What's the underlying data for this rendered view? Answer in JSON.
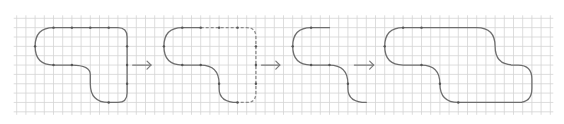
{
  "diagram": {
    "grid": {
      "columns": 58,
      "rows": 10
    },
    "colors": {
      "grid": "#d4d4d4",
      "path": "#6e6e6e",
      "dashed": "#8a8a8a",
      "node": "#555555"
    },
    "stages": [
      {
        "id": "stage-1",
        "style": "solid",
        "path": [
          [
            "M",
            2,
            3
          ],
          [
            "Q",
            2,
            1,
            4,
            1
          ],
          [
            "L",
            11,
            1
          ],
          [
            "Q",
            12,
            1,
            12,
            2
          ],
          [
            "L",
            12,
            8
          ],
          [
            "Q",
            12,
            9,
            11,
            9
          ],
          [
            "L",
            10,
            9
          ],
          [
            "Q",
            8,
            9,
            8,
            7
          ],
          [
            "L",
            8,
            6
          ],
          [
            "Q",
            8,
            5,
            6,
            5
          ],
          [
            "L",
            4,
            5
          ],
          [
            "Q",
            2,
            5,
            2,
            3
          ]
        ],
        "nodes": [
          [
            4,
            1
          ],
          [
            6,
            1
          ],
          [
            8,
            1
          ],
          [
            10,
            1
          ],
          [
            12,
            3
          ],
          [
            12,
            5
          ],
          [
            12,
            7
          ],
          [
            10,
            9
          ],
          [
            6,
            5
          ],
          [
            4,
            5
          ],
          [
            2,
            3
          ]
        ]
      },
      {
        "id": "stage-2",
        "style": "partial-dashed",
        "solid_path": [
          [
            "M",
            20,
            1
          ],
          [
            "L",
            18,
            1
          ],
          [
            "Q",
            16,
            1,
            16,
            3
          ],
          [
            "Q",
            16,
            5,
            18,
            5
          ],
          [
            "L",
            20,
            5
          ],
          [
            "Q",
            22,
            5,
            22,
            7
          ],
          [
            "L",
            22,
            7.5
          ],
          [
            "Q",
            22,
            9,
            24,
            9
          ]
        ],
        "dashed_path": [
          [
            "M",
            20,
            1
          ],
          [
            "L",
            25,
            1
          ],
          [
            "Q",
            26,
            1,
            26,
            2
          ],
          [
            "L",
            26,
            8
          ],
          [
            "Q",
            26,
            9,
            25,
            9
          ],
          [
            "L",
            24,
            9
          ]
        ],
        "nodes": [
          [
            18,
            1
          ],
          [
            20,
            1
          ],
          [
            22,
            1
          ],
          [
            24,
            1
          ],
          [
            26,
            3
          ],
          [
            26,
            5
          ],
          [
            26,
            7
          ],
          [
            24,
            9
          ],
          [
            22,
            7
          ],
          [
            20,
            5
          ],
          [
            18,
            5
          ],
          [
            16,
            3
          ]
        ]
      },
      {
        "id": "stage-3",
        "style": "open",
        "path": [
          [
            "M",
            34,
            1
          ],
          [
            "L",
            32,
            1
          ],
          [
            "Q",
            30,
            1,
            30,
            3
          ],
          [
            "Q",
            30,
            5,
            32,
            5
          ],
          [
            "L",
            34,
            5
          ],
          [
            "Q",
            36,
            5,
            36,
            7
          ],
          [
            "L",
            36,
            7.5
          ],
          [
            "Q",
            36,
            9,
            38,
            9
          ]
        ],
        "nodes": [
          [
            32,
            1
          ],
          [
            30,
            3
          ],
          [
            32,
            5
          ],
          [
            34,
            5
          ],
          [
            36,
            7
          ]
        ]
      },
      {
        "id": "stage-4",
        "style": "solid",
        "path": [
          [
            "M",
            40,
            3
          ],
          [
            "Q",
            40,
            1,
            42,
            1
          ],
          [
            "L",
            50,
            1
          ],
          [
            "Q",
            52,
            1,
            52,
            3
          ],
          [
            "Q",
            52,
            5,
            54,
            5
          ],
          [
            "L",
            54.5,
            5
          ],
          [
            "Q",
            56,
            5,
            56,
            6.5
          ],
          [
            "L",
            56,
            7.5
          ],
          [
            "Q",
            56,
            9,
            54.5,
            9
          ],
          [
            "L",
            48,
            9
          ],
          [
            "Q",
            46,
            9,
            46,
            7
          ],
          [
            "Q",
            46,
            5,
            44,
            5
          ],
          [
            "L",
            42,
            5
          ],
          [
            "Q",
            40,
            5,
            40,
            3
          ]
        ],
        "nodes": [
          [
            42,
            1
          ],
          [
            44,
            1
          ],
          [
            40,
            3
          ],
          [
            46,
            7
          ],
          [
            48,
            9
          ],
          [
            44,
            5
          ]
        ]
      }
    ],
    "arrows": [
      {
        "id": "arrow-1",
        "from": 12.6,
        "to": 14.6,
        "row": 5
      },
      {
        "id": "arrow-2",
        "from": 26.6,
        "to": 28.6,
        "row": 5
      },
      {
        "id": "arrow-3",
        "from": 36.7,
        "to": 38.8,
        "row": 5
      }
    ]
  }
}
